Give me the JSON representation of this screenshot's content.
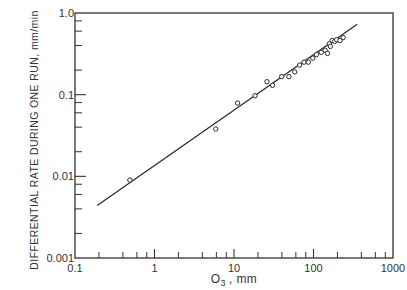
{
  "chart_data": {
    "type": "scatter",
    "title": "",
    "xlabel": "O3 , mm",
    "xlabel_main": "O",
    "xlabel_sub": "3",
    "xlabel_unit": ", mm",
    "ylabel": "DIFFERENTIAL RATE DURING ONE RUN, mm/min",
    "xscale": "log",
    "yscale": "log",
    "xlim": [
      0.1,
      1000
    ],
    "ylim": [
      0.001,
      1.0
    ],
    "grid": false,
    "legend": null,
    "x_tick_labels": [
      "0.1",
      "1",
      "10",
      "100",
      "1000"
    ],
    "y_tick_labels": [
      "0.001",
      "0.01",
      "0.1",
      "1.0"
    ],
    "series": [
      {
        "name": "measured",
        "marker": "open-circle",
        "points": [
          [
            0.49,
            0.009
          ],
          [
            5.9,
            0.038
          ],
          [
            11.1,
            0.079
          ],
          [
            18.4,
            0.097
          ],
          [
            26,
            0.144
          ],
          [
            30.6,
            0.13
          ],
          [
            39.8,
            0.166
          ],
          [
            49,
            0.166
          ],
          [
            58,
            0.19
          ],
          [
            67,
            0.23
          ],
          [
            76,
            0.25
          ],
          [
            86,
            0.25
          ],
          [
            98,
            0.28
          ],
          [
            109,
            0.31
          ],
          [
            125,
            0.33
          ],
          [
            140,
            0.35
          ],
          [
            150,
            0.32
          ],
          [
            158,
            0.42
          ],
          [
            163,
            0.39
          ],
          [
            172,
            0.46
          ],
          [
            185,
            0.45
          ],
          [
            196,
            0.47
          ],
          [
            215,
            0.46
          ],
          [
            236,
            0.5
          ]
        ]
      },
      {
        "name": "fit",
        "style": "line",
        "points": [
          [
            0.19,
            0.0044
          ],
          [
            355,
            0.73
          ]
        ]
      }
    ]
  }
}
